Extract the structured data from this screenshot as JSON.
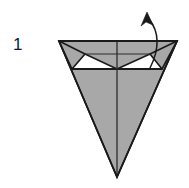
{
  "figure": {
    "kind": "origami-fold-diagram",
    "step_number": "1",
    "caption": "",
    "canvas": {
      "width": 189,
      "height": 188,
      "background": "#ffffff"
    },
    "colors": {
      "paper_front": "#a8a8a8",
      "paper_back": "#ffffff",
      "outline": "#1a1a1a",
      "crease": "#2b2b2b",
      "arrow": "#1a1a1a",
      "label": "#1a1a1a"
    },
    "shapes": {
      "body_triangle": {
        "name": "inverted-triangle-body",
        "points": "59,41 177,41 117,177",
        "fill": "#a8a8a8",
        "stroke": "#1a1a1a",
        "stroke_width": 1.6
      },
      "left_flap": {
        "name": "left-folded-flap",
        "points": "59,41 85,54 72,69",
        "fill": "#a8a8a8",
        "stroke": "#1a1a1a",
        "stroke_width": 1.6
      },
      "right_flap": {
        "name": "right-folded-flap",
        "points": "177,41 150,54 162,69",
        "fill": "#a8a8a8",
        "stroke": "#1a1a1a",
        "stroke_width": 1.6
      },
      "left_notch": {
        "name": "left-white-notch",
        "points": "85,54 117,69 72,69",
        "fill": "#ffffff",
        "stroke": "#1a1a1a",
        "stroke_width": 1.6
      },
      "right_notch": {
        "name": "right-white-notch",
        "points": "150,54 162,69 117,69",
        "fill": "#ffffff",
        "stroke": "#1a1a1a",
        "stroke_width": 1.6
      },
      "pocket_top_line": {
        "name": "pocket-top-crease",
        "from": "85,54",
        "to": "150,54"
      },
      "pocket_bottom_line": {
        "name": "pocket-bottom-crease",
        "from": "72,69",
        "to": "162,69"
      },
      "center_crease": {
        "name": "vertical-center-crease",
        "from": "117,41",
        "to": "117,177"
      },
      "left_diagonal_crease": {
        "name": "left-diagonal-crease",
        "from": "59,41",
        "to": "117,177"
      },
      "right_diagonal_crease": {
        "name": "right-diagonal-crease",
        "from": "177,41",
        "to": "117,177"
      }
    },
    "arrow": {
      "name": "fold-direction-arrow",
      "path": "M 150,68 C 158,52 161,34 149,19",
      "head_points": "147,12 153,25 146,22 141,26",
      "direction": "up-and-out",
      "stroke_width": 1.5
    }
  }
}
